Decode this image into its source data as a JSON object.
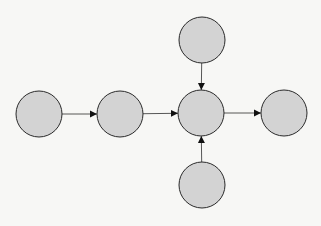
{
  "diagram": {
    "type": "directed-graph",
    "node_fill": "#d3d3d3",
    "node_stroke": "#2a2a2a",
    "edge_color": "#444444",
    "nodes": [
      {
        "id": "n1",
        "label": "",
        "cx": 39,
        "cy": 114,
        "r": 23
      },
      {
        "id": "n2",
        "label": "",
        "cx": 120,
        "cy": 114,
        "r": 23
      },
      {
        "id": "n3",
        "label": "",
        "cx": 201,
        "cy": 113,
        "r": 23
      },
      {
        "id": "n4",
        "label": "",
        "cx": 284,
        "cy": 113,
        "r": 23
      },
      {
        "id": "n5",
        "label": "",
        "cx": 202,
        "cy": 40,
        "r": 23
      },
      {
        "id": "n6",
        "label": "",
        "cx": 202,
        "cy": 185,
        "r": 23
      }
    ],
    "edges": [
      {
        "from": "n1",
        "to": "n2"
      },
      {
        "from": "n2",
        "to": "n3"
      },
      {
        "from": "n3",
        "to": "n4"
      },
      {
        "from": "n5",
        "to": "n3"
      },
      {
        "from": "n6",
        "to": "n3"
      }
    ]
  }
}
